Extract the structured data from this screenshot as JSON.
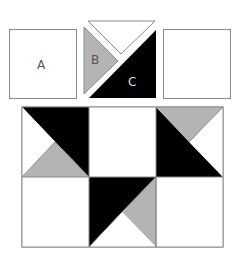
{
  "pieces": {
    "a": {
      "label": "A"
    },
    "b": {
      "label": "B"
    },
    "c": {
      "label": "C"
    }
  },
  "colors": {
    "black": "#000000",
    "gray": "#b4b4b4",
    "white": "#ffffff",
    "stroke": "#8a8a8a",
    "label_dark": "#555555",
    "label_light": "#dddddd"
  }
}
